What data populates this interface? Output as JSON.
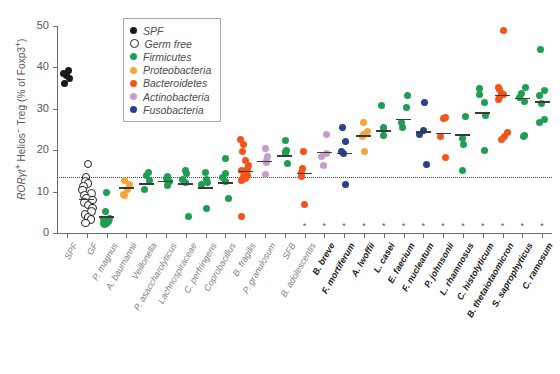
{
  "chart_data": {
    "type": "scatter",
    "title": "",
    "xlabel": "",
    "ylabel": "RORγt+ Helios− Treg (% of Foxp3+)",
    "ylim": [
      0,
      50
    ],
    "yticks": [
      0,
      10,
      20,
      30,
      40,
      50
    ],
    "grid": false,
    "reference_line": {
      "value": 13.5,
      "style": "dotted",
      "label": ""
    },
    "legend_position": "top-left",
    "legend": [
      {
        "name": "SPF",
        "color": "#1a1a1a",
        "marker": "filled-circle"
      },
      {
        "name": "Germ free",
        "color": "#ffffff",
        "marker": "open-circle"
      },
      {
        "name": "Firmicutes",
        "color": "#1e9e52",
        "marker": "filled-circle"
      },
      {
        "name": "Proteobacteria",
        "color": "#f2a73b",
        "marker": "filled-circle"
      },
      {
        "name": "Bacteroidetes",
        "color": "#f4541a",
        "marker": "filled-circle"
      },
      {
        "name": "Actinobacteria",
        "color": "#c79dc8",
        "marker": "filled-circle"
      },
      {
        "name": "Fusobacteria",
        "color": "#2b3f8f",
        "marker": "filled-circle"
      }
    ],
    "categories": [
      {
        "label": "SPF",
        "group": "SPF",
        "significant": false,
        "bold": false,
        "mean": null,
        "values": [
          39.3,
          38.6,
          38.0,
          37.4,
          36.2
        ]
      },
      {
        "label": "GF",
        "group": "Germ free",
        "significant": false,
        "bold": false,
        "mean": 8.2,
        "values": [
          16.9,
          13.6,
          12.7,
          12.2,
          11.4,
          10.6,
          9.8,
          9.2,
          8.6,
          8.2,
          7.6,
          7.0,
          6.2,
          5.4,
          4.6,
          4.0,
          3.4,
          2.6
        ]
      },
      {
        "label": "P. magnus",
        "group": "Firmicutes",
        "significant": false,
        "bold": false,
        "mean": 4.0,
        "values": [
          9.8,
          5.2,
          3.6,
          3.2,
          2.8,
          2.4,
          2.2,
          2.0
        ]
      },
      {
        "label": "A. baumannii",
        "group": "Proteobacteria",
        "significant": false,
        "bold": false,
        "mean": 11.0,
        "values": [
          12.8,
          11.6,
          10.6,
          9.4,
          9.0
        ]
      },
      {
        "label": "Veillonella",
        "group": "Firmicutes",
        "significant": false,
        "bold": false,
        "mean": 12.0,
        "values": [
          14.6,
          14.0,
          12.8,
          10.4
        ]
      },
      {
        "label": "P. asaccharolyticus",
        "group": "Firmicutes",
        "significant": false,
        "bold": false,
        "mean": 12.6,
        "values": [
          13.6,
          13.2,
          12.8,
          12.4,
          11.4
        ]
      },
      {
        "label": "Lachnospiraceae",
        "group": "Firmicutes",
        "significant": false,
        "bold": false,
        "mean": 12.0,
        "values": [
          15.2,
          14.4,
          13.0,
          12.2,
          4.0
        ]
      },
      {
        "label": "C. perfringens",
        "group": "Firmicutes",
        "significant": false,
        "bold": false,
        "mean": 11.0,
        "values": [
          14.6,
          13.0,
          12.2,
          11.6,
          6.0
        ]
      },
      {
        "label": "Coprobacillus",
        "group": "Firmicutes",
        "significant": false,
        "bold": false,
        "mean": 12.2,
        "values": [
          18.0,
          14.4,
          13.4,
          12.4,
          8.4
        ]
      },
      {
        "label": "B. fragilis",
        "group": "Bacteroidetes",
        "significant": false,
        "bold": false,
        "mean": 15.0,
        "values": [
          22.6,
          21.4,
          19.8,
          17.4,
          16.4,
          15.6,
          15.0,
          14.6,
          14.0,
          13.6,
          13.2,
          12.8,
          4.0
        ]
      },
      {
        "label": "P. granulosum",
        "group": "Actinobacteria",
        "significant": false,
        "bold": false,
        "mean": 17.4,
        "values": [
          20.4,
          18.4,
          17.6,
          17.0,
          14.2
        ]
      },
      {
        "label": "SFB",
        "group": "Firmicutes",
        "significant": false,
        "bold": false,
        "mean": 18.8,
        "values": [
          22.4,
          20.0,
          19.6,
          19.2,
          16.8
        ]
      },
      {
        "label": "B. adolescentis",
        "group": "Bacteroidetes",
        "significant": true,
        "bold": false,
        "mean": 14.6,
        "values": [
          19.8,
          15.6,
          14.6,
          13.6,
          6.8
        ]
      },
      {
        "label": "B. breve",
        "group": "Actinobacteria",
        "significant": true,
        "bold": true,
        "mean": 19.6,
        "values": [
          23.8,
          19.2,
          18.4,
          16.4
        ]
      },
      {
        "label": "F. mortiferum",
        "group": "Fusobacteria",
        "significant": true,
        "bold": true,
        "mean": 19.4,
        "values": [
          25.4,
          22.0,
          19.6,
          19.2,
          11.6
        ]
      },
      {
        "label": "A. lwoffii",
        "group": "Proteobacteria",
        "significant": true,
        "bold": true,
        "mean": 23.6,
        "values": [
          26.6,
          24.4,
          23.8,
          23.2,
          19.8
        ]
      },
      {
        "label": "L. casei",
        "group": "Firmicutes",
        "significant": true,
        "bold": true,
        "mean": 24.8,
        "values": [
          30.8,
          25.6,
          25.0,
          23.6
        ]
      },
      {
        "label": "E. faecium",
        "group": "Firmicutes",
        "significant": true,
        "bold": true,
        "mean": 27.6,
        "values": [
          33.2,
          30.4,
          26.8,
          25.4
        ]
      },
      {
        "label": "F. nucleatum",
        "group": "Fusobacteria",
        "significant": true,
        "bold": true,
        "mean": 24.6,
        "values": [
          31.6,
          24.8,
          23.8,
          16.6
        ]
      },
      {
        "label": "P. johnsonii",
        "group": "Bacteroidetes",
        "significant": true,
        "bold": true,
        "mean": 24.2,
        "values": [
          27.8,
          27.6,
          23.4,
          18.2
        ]
      },
      {
        "label": "L. rhamnosus",
        "group": "Firmicutes",
        "significant": true,
        "bold": true,
        "mean": 23.8,
        "values": [
          28.2,
          22.8,
          21.4,
          15.2
        ]
      },
      {
        "label": "C. histolyticum",
        "group": "Firmicutes",
        "significant": true,
        "bold": true,
        "mean": 29.2,
        "values": [
          35.0,
          33.4,
          31.6,
          28.4,
          20.0
        ]
      },
      {
        "label": "B. thetaiotaomicron",
        "group": "Bacteroidetes",
        "significant": true,
        "bold": true,
        "mean": 33.4,
        "values": [
          48.8,
          35.2,
          34.6,
          33.8,
          33.4,
          32.8,
          32.2,
          24.2,
          23.2,
          22.6
        ]
      },
      {
        "label": "S. saprophyticus",
        "group": "Firmicutes",
        "significant": true,
        "bold": true,
        "mean": 32.6,
        "values": [
          35.2,
          33.6,
          32.8,
          31.8,
          23.6,
          23.2
        ]
      },
      {
        "label": "C. ramosum",
        "group": "Firmicutes",
        "significant": true,
        "bold": true,
        "mean": 31.8,
        "values": [
          44.4,
          34.4,
          33.2,
          31.4,
          27.4,
          26.6
        ]
      }
    ]
  },
  "axis": {
    "y_tick_labels": [
      "0",
      "10",
      "20",
      "30",
      "40",
      "50"
    ],
    "significance_marker": "*"
  }
}
